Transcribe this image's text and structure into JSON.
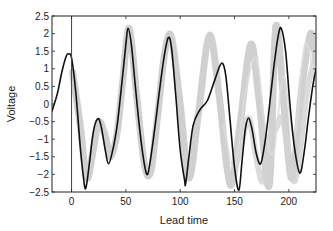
{
  "chart_data": {
    "type": "line",
    "title": "",
    "xlabel": "Lead time",
    "ylabel": "Voltage",
    "xlim": [
      -18,
      225
    ],
    "ylim": [
      -2.5,
      2.5
    ],
    "xticks": [
      0,
      50,
      100,
      150,
      200
    ],
    "yticks": [
      2.5,
      2,
      1.5,
      1,
      0.5,
      0,
      -0.5,
      -1,
      -1.5,
      -2,
      -2.5
    ],
    "ytick_labels": [
      "2.5",
      "2",
      "1.5",
      "1",
      "0.5",
      "0",
      "−0.5",
      "−1",
      "−1.5",
      "−2",
      "−2.5"
    ],
    "grid": false,
    "legend": null,
    "vline_x": 0,
    "series": [
      {
        "name": "ensemble",
        "color": "#c8c8c8",
        "width": 7,
        "opacity": 0.85,
        "x": [
          1,
          8,
          14,
          20,
          25,
          31,
          36,
          42,
          47,
          53,
          60,
          67,
          73,
          80,
          86,
          92,
          100,
          108,
          117,
          127,
          136,
          146,
          155,
          165,
          173,
          182,
          188,
          196,
          203,
          212,
          220,
          225
        ],
        "y": [
          0.9,
          -0.6,
          -2.1,
          -1.3,
          -0.5,
          -0.9,
          -1.5,
          -0.8,
          0.6,
          2.15,
          0.2,
          -1.7,
          -1.9,
          -0.1,
          1.5,
          1.9,
          0.0,
          -2.1,
          -0.2,
          1.95,
          0.2,
          -2.3,
          -0.6,
          1.7,
          0.0,
          -2.3,
          2.2,
          -0.2,
          -2.1,
          0.5,
          2.0,
          1.2
        ]
      },
      {
        "name": "ensemble-low",
        "color": "#d2d2d2",
        "width": 6,
        "opacity": 0.8,
        "x": [
          150,
          156,
          163,
          170,
          176,
          182,
          188,
          194,
          200,
          205,
          210,
          217,
          225
        ],
        "y": [
          -1.9,
          -1.2,
          -0.4,
          -1.5,
          -2.2,
          -1.0,
          -0.7,
          -0.4,
          -1.5,
          -2.2,
          -1.4,
          0.4,
          1.4
        ]
      },
      {
        "name": "ensemble-faint",
        "color": "#dcdcdc",
        "width": 2,
        "opacity": 0.8,
        "x": [
          140,
          150,
          160,
          170,
          178,
          186,
          195,
          205,
          215,
          225
        ],
        "y": [
          -0.6,
          -1.8,
          0.3,
          1.3,
          -0.6,
          -1.4,
          0.8,
          -0.9,
          1.7,
          0.4
        ]
      },
      {
        "name": "observed",
        "color": "#111111",
        "width": 1.6,
        "opacity": 1,
        "x": [
          -18,
          -13,
          -9,
          -5,
          -3,
          0,
          4,
          8,
          11,
          13,
          16,
          20,
          24,
          27,
          31,
          34,
          38,
          42,
          46,
          50,
          52,
          55,
          59,
          63,
          67,
          70,
          73,
          77,
          81,
          85,
          89,
          92,
          96,
          100,
          104,
          105,
          108,
          112,
          118,
          125,
          132,
          138,
          142,
          146,
          150,
          154,
          157,
          160,
          163,
          166,
          170,
          174,
          178,
          182,
          186,
          190,
          193,
          197,
          201,
          205,
          210,
          214,
          218,
          222,
          225
        ],
        "y": [
          -0.2,
          0.3,
          0.9,
          1.35,
          1.42,
          1.3,
          0.3,
          -1.2,
          -2.1,
          -2.4,
          -1.8,
          -0.8,
          -0.42,
          -0.6,
          -1.3,
          -1.7,
          -1.3,
          -0.6,
          0.5,
          1.7,
          2.15,
          1.7,
          0.4,
          -0.8,
          -1.7,
          -2.0,
          -1.5,
          -0.6,
          0.4,
          1.3,
          1.88,
          1.6,
          0.2,
          -1.3,
          -2.15,
          -2.27,
          -1.5,
          -0.6,
          -0.17,
          0.1,
          0.7,
          1.16,
          0.8,
          -0.5,
          -1.8,
          -2.45,
          -1.6,
          -0.7,
          -0.4,
          -0.7,
          -1.4,
          -1.7,
          -1.1,
          -0.1,
          1.0,
          1.9,
          2.15,
          1.5,
          0.0,
          -1.2,
          -1.96,
          -1.4,
          -0.4,
          0.5,
          1.0
        ]
      }
    ]
  }
}
